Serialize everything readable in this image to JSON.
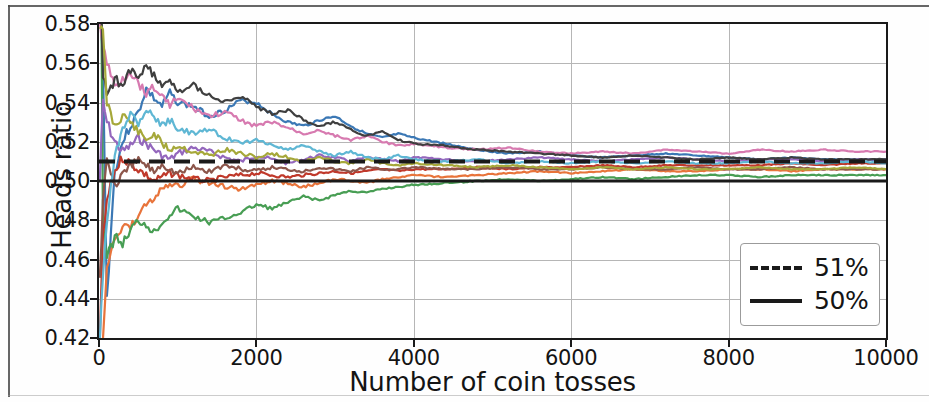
{
  "figure": {
    "background_color": "#ffffff",
    "axes_color": "#1a1a1a",
    "grid_color": "#b6b6b6"
  },
  "axis": {
    "ylabel": "Heads ratio",
    "xlabel": "Number of coin tosses",
    "yticks": [
      "0.42",
      "0.44",
      "0.46",
      "0.48",
      "0.50",
      "0.52",
      "0.54",
      "0.56",
      "0.58"
    ],
    "xticks": [
      "0",
      "2000",
      "4000",
      "6000",
      "8000",
      "10000"
    ]
  },
  "legend": {
    "items": [
      {
        "label": "51%",
        "style": "dashed",
        "color": "#1a1a1a"
      },
      {
        "label": "50%",
        "style": "solid",
        "color": "#1a1a1a"
      }
    ]
  },
  "chart_data": {
    "type": "line",
    "title": "",
    "xlabel": "Number of coin tosses",
    "ylabel": "Heads ratio",
    "xlim": [
      0,
      10000
    ],
    "ylim": [
      0.42,
      0.58
    ],
    "xticks": [
      0,
      2000,
      4000,
      6000,
      8000,
      10000
    ],
    "yticks": [
      0.42,
      0.44,
      0.46,
      0.48,
      0.5,
      0.52,
      0.54,
      0.56,
      0.58
    ],
    "grid": true,
    "legend_position": "lower right",
    "reference_lines": [
      {
        "name": "51%",
        "y": 0.51,
        "style": "dashed",
        "color": "#1a1a1a",
        "linewidth": 4
      },
      {
        "name": "50%",
        "y": 0.5,
        "style": "solid",
        "color": "#1a1a1a",
        "linewidth": 3
      }
    ],
    "x": [
      10,
      50,
      100,
      200,
      300,
      400,
      500,
      600,
      700,
      800,
      900,
      1000,
      1200,
      1400,
      1600,
      1800,
      2000,
      2200,
      2400,
      2600,
      2800,
      3000,
      3200,
      3400,
      3600,
      3800,
      4000,
      4400,
      4800,
      5200,
      5600,
      6000,
      6400,
      6800,
      7200,
      7600,
      8000,
      8400,
      8800,
      9200,
      9600,
      10000
    ],
    "series": [
      {
        "name": "trial-1",
        "color": "#3b78b5",
        "values": [
          0.6,
          0.56,
          0.44,
          0.505,
          0.52,
          0.528,
          0.535,
          0.547,
          0.542,
          0.538,
          0.545,
          0.54,
          0.538,
          0.533,
          0.536,
          0.541,
          0.54,
          0.534,
          0.53,
          0.528,
          0.531,
          0.533,
          0.528,
          0.524,
          0.522,
          0.524,
          0.522,
          0.519,
          0.516,
          0.514,
          0.515,
          0.513,
          0.512,
          0.513,
          0.514,
          0.513,
          0.512,
          0.511,
          0.512,
          0.511,
          0.511,
          0.511
        ]
      },
      {
        "name": "trial-2",
        "color": "#e8743b",
        "values": [
          0.3,
          0.42,
          0.455,
          0.47,
          0.478,
          0.476,
          0.482,
          0.488,
          0.492,
          0.495,
          0.498,
          0.497,
          0.501,
          0.499,
          0.497,
          0.496,
          0.498,
          0.5,
          0.499,
          0.497,
          0.499,
          0.501,
          0.5,
          0.499,
          0.501,
          0.502,
          0.503,
          0.502,
          0.503,
          0.504,
          0.505,
          0.504,
          0.505,
          0.506,
          0.505,
          0.505,
          0.506,
          0.506,
          0.505,
          0.506,
          0.506,
          0.506
        ]
      },
      {
        "name": "trial-3",
        "color": "#489e54",
        "values": [
          0.7,
          0.48,
          0.46,
          0.472,
          0.468,
          0.475,
          0.48,
          0.478,
          0.474,
          0.479,
          0.483,
          0.486,
          0.482,
          0.479,
          0.481,
          0.484,
          0.488,
          0.486,
          0.489,
          0.492,
          0.49,
          0.493,
          0.495,
          0.494,
          0.496,
          0.497,
          0.498,
          0.499,
          0.5,
          0.501,
          0.5,
          0.501,
          0.502,
          0.501,
          0.502,
          0.503,
          0.503,
          0.502,
          0.503,
          0.503,
          0.503,
          0.503
        ]
      },
      {
        "name": "trial-4",
        "color": "#c0392b",
        "values": [
          0.42,
          0.47,
          0.49,
          0.505,
          0.512,
          0.509,
          0.506,
          0.503,
          0.5,
          0.502,
          0.504,
          0.503,
          0.501,
          0.5,
          0.502,
          0.503,
          0.504,
          0.503,
          0.502,
          0.503,
          0.504,
          0.505,
          0.504,
          0.505,
          0.506,
          0.505,
          0.506,
          0.506,
          0.507,
          0.506,
          0.507,
          0.507,
          0.508,
          0.507,
          0.508,
          0.508,
          0.508,
          0.508,
          0.509,
          0.508,
          0.509,
          0.509
        ]
      },
      {
        "name": "trial-5",
        "color": "#9467bd",
        "values": [
          0.5,
          0.54,
          0.53,
          0.52,
          0.515,
          0.518,
          0.522,
          0.519,
          0.516,
          0.513,
          0.511,
          0.514,
          0.517,
          0.515,
          0.512,
          0.51,
          0.513,
          0.511,
          0.509,
          0.511,
          0.513,
          0.512,
          0.51,
          0.512,
          0.511,
          0.51,
          0.512,
          0.511,
          0.51,
          0.511,
          0.512,
          0.511,
          0.51,
          0.511,
          0.512,
          0.511,
          0.51,
          0.511,
          0.511,
          0.51,
          0.511,
          0.511
        ]
      },
      {
        "name": "trial-6",
        "color": "#8c564b",
        "values": [
          0.45,
          0.49,
          0.512,
          0.498,
          0.503,
          0.507,
          0.511,
          0.508,
          0.505,
          0.509,
          0.506,
          0.504,
          0.507,
          0.505,
          0.508,
          0.506,
          0.505,
          0.507,
          0.506,
          0.505,
          0.507,
          0.506,
          0.505,
          0.507,
          0.506,
          0.506,
          0.507,
          0.506,
          0.506,
          0.507,
          0.506,
          0.506,
          0.507,
          0.506,
          0.506,
          0.507,
          0.506,
          0.506,
          0.507,
          0.506,
          0.506,
          0.506
        ]
      },
      {
        "name": "trial-7",
        "color": "#d77ab0",
        "values": [
          0.58,
          0.57,
          0.56,
          0.548,
          0.552,
          0.556,
          0.55,
          0.545,
          0.548,
          0.543,
          0.539,
          0.542,
          0.537,
          0.533,
          0.535,
          0.531,
          0.528,
          0.53,
          0.527,
          0.524,
          0.526,
          0.523,
          0.521,
          0.523,
          0.52,
          0.518,
          0.519,
          0.517,
          0.516,
          0.517,
          0.515,
          0.514,
          0.515,
          0.514,
          0.516,
          0.515,
          0.514,
          0.516,
          0.515,
          0.516,
          0.515,
          0.515
        ]
      },
      {
        "name": "trial-8",
        "color": "#3f3f3f",
        "values": [
          0.62,
          0.555,
          0.545,
          0.552,
          0.548,
          0.556,
          0.553,
          0.558,
          0.554,
          0.549,
          0.551,
          0.546,
          0.549,
          0.544,
          0.54,
          0.543,
          0.538,
          0.534,
          0.536,
          0.531,
          0.528,
          0.53,
          0.526,
          0.523,
          0.525,
          0.521,
          0.519,
          0.518,
          0.516,
          0.515,
          0.514,
          0.513,
          0.512,
          0.513,
          0.512,
          0.511,
          0.512,
          0.511,
          0.512,
          0.511,
          0.511,
          0.511
        ]
      },
      {
        "name": "trial-9",
        "color": "#a6a83a",
        "values": [
          0.58,
          0.575,
          0.54,
          0.528,
          0.534,
          0.53,
          0.525,
          0.521,
          0.524,
          0.519,
          0.516,
          0.518,
          0.515,
          0.513,
          0.516,
          0.514,
          0.512,
          0.514,
          0.512,
          0.51,
          0.512,
          0.51,
          0.509,
          0.511,
          0.509,
          0.508,
          0.509,
          0.508,
          0.507,
          0.508,
          0.507,
          0.506,
          0.507,
          0.506,
          0.507,
          0.506,
          0.506,
          0.507,
          0.506,
          0.506,
          0.507,
          0.506
        ]
      },
      {
        "name": "trial-10",
        "color": "#5fb7d4",
        "values": [
          0.42,
          0.45,
          0.48,
          0.512,
          0.528,
          0.535,
          0.53,
          0.537,
          0.533,
          0.528,
          0.531,
          0.527,
          0.524,
          0.526,
          0.522,
          0.519,
          0.521,
          0.518,
          0.516,
          0.518,
          0.515,
          0.513,
          0.515,
          0.512,
          0.511,
          0.513,
          0.511,
          0.51,
          0.511,
          0.509,
          0.51,
          0.509,
          0.51,
          0.509,
          0.51,
          0.509,
          0.509,
          0.51,
          0.509,
          0.509,
          0.51,
          0.509
        ]
      }
    ]
  }
}
